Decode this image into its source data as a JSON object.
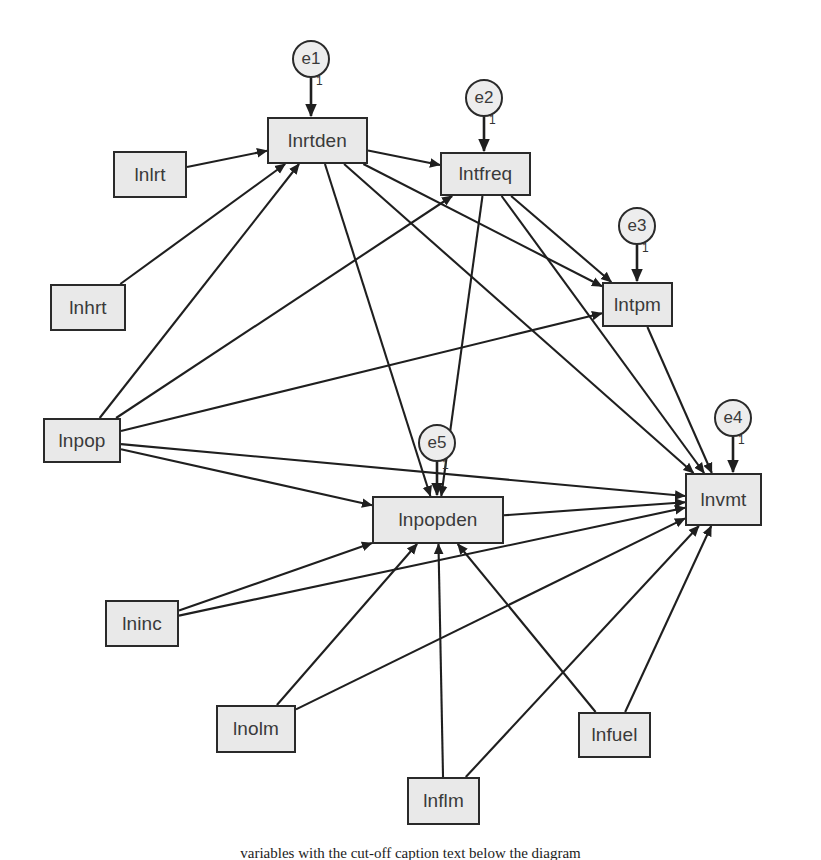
{
  "diagram": {
    "type": "sem-path-diagram",
    "background_color": "#ffffff",
    "box_fill": "#e9e9e9",
    "box_stroke": "#2a2a2a",
    "circle_fill": "#ededed",
    "line_color": "#1f1f1f",
    "error_weight_label": "1",
    "observed_variables": [
      {
        "id": "lnlrt",
        "label": "lnlrt",
        "x": 113,
        "y": 151,
        "w": 74,
        "h": 47
      },
      {
        "id": "lnhrt",
        "label": "lnhrt",
        "x": 50,
        "y": 284,
        "w": 76,
        "h": 47
      },
      {
        "id": "lnpop",
        "label": "lnpop",
        "x": 43,
        "y": 418,
        "w": 78,
        "h": 45
      },
      {
        "id": "lninc",
        "label": "lninc",
        "x": 105,
        "y": 600,
        "w": 74,
        "h": 47
      },
      {
        "id": "lnolm",
        "label": "lnolm",
        "x": 216,
        "y": 705,
        "w": 80,
        "h": 48
      },
      {
        "id": "lnflm",
        "label": "lnflm",
        "x": 407,
        "y": 777,
        "w": 73,
        "h": 48
      },
      {
        "id": "lnfuel",
        "label": "lnfuel",
        "x": 578,
        "y": 712,
        "w": 73,
        "h": 46
      }
    ],
    "endogenous_variables": [
      {
        "id": "lnrtden",
        "label": "lnrtden",
        "x": 267,
        "y": 117,
        "w": 101,
        "h": 47
      },
      {
        "id": "lntfreq",
        "label": "lntfreq",
        "x": 440,
        "y": 152,
        "w": 91,
        "h": 44
      },
      {
        "id": "lntpm",
        "label": "lntpm",
        "x": 602,
        "y": 282,
        "w": 71,
        "h": 45
      },
      {
        "id": "lnpopden",
        "label": "lnpopden",
        "x": 372,
        "y": 496,
        "w": 132,
        "h": 48
      },
      {
        "id": "lnvmt",
        "label": "lnvmt",
        "x": 685,
        "y": 473,
        "w": 77,
        "h": 53
      }
    ],
    "error_terms": [
      {
        "id": "e1",
        "label": "e1",
        "cx": 311,
        "cy": 59,
        "r": 19,
        "target": "lnrtden",
        "weight": "1"
      },
      {
        "id": "e2",
        "label": "e2",
        "cx": 484,
        "cy": 98,
        "r": 19,
        "target": "lntfreq",
        "weight": "1"
      },
      {
        "id": "e3",
        "label": "e3",
        "cx": 637,
        "cy": 226,
        "r": 19,
        "target": "lntpm",
        "weight": "1"
      },
      {
        "id": "e4",
        "label": "e4",
        "cx": 733,
        "cy": 418,
        "r": 19,
        "target": "lnvmt",
        "weight": "1"
      },
      {
        "id": "e5",
        "label": "e5",
        "cx": 437,
        "cy": 443,
        "r": 19,
        "target": "lnpopden",
        "weight": "1"
      }
    ],
    "paths": [
      {
        "from": "lnlrt",
        "to": "lnrtden"
      },
      {
        "from": "lnhrt",
        "to": "lnrtden"
      },
      {
        "from": "lnpop",
        "to": "lnrtden"
      },
      {
        "from": "lnpop",
        "to": "lntfreq"
      },
      {
        "from": "lnpop",
        "to": "lntpm"
      },
      {
        "from": "lnpop",
        "to": "lnpopden"
      },
      {
        "from": "lnpop",
        "to": "lnvmt"
      },
      {
        "from": "lnrtden",
        "to": "lntfreq"
      },
      {
        "from": "lnrtden",
        "to": "lntpm"
      },
      {
        "from": "lnrtden",
        "to": "lnpopden"
      },
      {
        "from": "lnrtden",
        "to": "lnvmt"
      },
      {
        "from": "lntfreq",
        "to": "lntpm"
      },
      {
        "from": "lntfreq",
        "to": "lnpopden"
      },
      {
        "from": "lntfreq",
        "to": "lnvmt"
      },
      {
        "from": "lntpm",
        "to": "lnvmt"
      },
      {
        "from": "lnpopden",
        "to": "lnvmt"
      },
      {
        "from": "lninc",
        "to": "lnpopden"
      },
      {
        "from": "lninc",
        "to": "lnvmt"
      },
      {
        "from": "lnolm",
        "to": "lnpopden"
      },
      {
        "from": "lnolm",
        "to": "lnvmt"
      },
      {
        "from": "lnflm",
        "to": "lnpopden"
      },
      {
        "from": "lnflm",
        "to": "lnvmt"
      },
      {
        "from": "lnfuel",
        "to": "lnpopden"
      },
      {
        "from": "lnfuel",
        "to": "lnvmt"
      }
    ]
  },
  "caption": {
    "clipped_line": "variables with the cut-off caption text below the diagram"
  }
}
